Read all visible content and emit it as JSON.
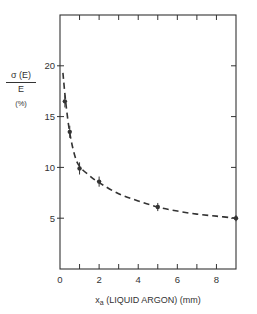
{
  "chart_data": {
    "type": "scatter",
    "title": "",
    "xlabel": "x_a (LIQUID ARGON) (mm)",
    "xlabel_main": "x",
    "xlabel_sub": "a",
    "xlabel_rest": "(LIQUID ARGON) (mm)",
    "ylabel_numerator": "σ (E)",
    "ylabel_denominator": "E",
    "ylabel_unit": "(%)",
    "xlim": [
      0,
      9
    ],
    "ylim": [
      0,
      25
    ],
    "x_ticks": [
      0,
      2,
      4,
      6,
      8
    ],
    "x_minor_ticks": [
      1,
      3,
      5,
      7
    ],
    "y_ticks": [
      5,
      10,
      15,
      20
    ],
    "x_tick_labels": [
      "0",
      "2",
      "4",
      "6",
      "8"
    ],
    "y_tick_labels": [
      "5",
      "10",
      "15",
      "20"
    ],
    "grid": false,
    "series": [
      {
        "name": "measured",
        "style": "points with error bars",
        "x": [
          0.25,
          0.5,
          1.0,
          2.0,
          5.0,
          9.0
        ],
        "y": [
          16.5,
          13.5,
          9.9,
          8.6,
          6.1,
          5.0
        ],
        "yerr": [
          0.6,
          0.6,
          0.6,
          0.5,
          0.4,
          0.3
        ]
      },
      {
        "name": "fit",
        "style": "dashed line",
        "x": [
          0.15,
          0.3,
          0.5,
          0.75,
          1.0,
          1.5,
          2.0,
          3.0,
          4.0,
          5.0,
          6.0,
          7.0,
          8.0,
          9.0
        ],
        "y": [
          19.3,
          16.3,
          13.4,
          11.2,
          10.1,
          9.2,
          8.5,
          7.4,
          6.7,
          6.1,
          5.7,
          5.4,
          5.2,
          5.0
        ]
      }
    ]
  },
  "colors": {
    "ink": "#333333",
    "background": "#ffffff"
  }
}
